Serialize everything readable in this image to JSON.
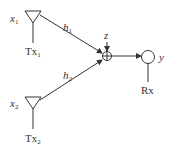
{
  "diagram": {
    "type": "MISO channel / superposition at receiver",
    "transmitters": [
      {
        "id": "tx1",
        "signal": "x",
        "signal_sub": "1",
        "name": "Tx",
        "name_sub": "1",
        "channel": "h",
        "channel_sub": "1"
      },
      {
        "id": "tx2",
        "signal": "x",
        "signal_sub": "2",
        "name": "Tx",
        "name_sub": "2",
        "channel": "h",
        "channel_sub": "2"
      }
    ],
    "noise": {
      "label": "z"
    },
    "summer": {
      "symbol": "plus-circle"
    },
    "receiver": {
      "name": "Rx",
      "output": "y"
    },
    "colors": {
      "stroke": "#333333",
      "background": "#ffffff"
    }
  }
}
